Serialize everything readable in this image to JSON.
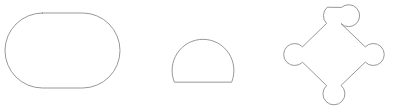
{
  "page": {
    "background_color": "#ffffff",
    "width": 393,
    "height": 109
  },
  "style": {
    "stroke_color": "#8c8c8c",
    "stroke_width": 0.9,
    "fill": "none"
  },
  "figure": {
    "shape_count": 3
  },
  "shapes": [
    {
      "index": 1,
      "name": "stadium-rounded-rectangle",
      "label": "Rounded rectangle (stadium)",
      "position": "left",
      "bounds": {
        "x": 5,
        "y": 13,
        "width": 115,
        "height": 75
      },
      "center": {
        "x": 62.5,
        "y": 50.5
      },
      "corner_radius": 37.5,
      "path": "M 42.5 13 L 82.5 13 A 37.5 37.5 0 0 1 82.5 88 L 42.5 88 A 37.5 37.5 0 0 1 42.5 13 Z"
    },
    {
      "index": 2,
      "name": "flat-bottom-circle-dome",
      "label": "Circle with flat bottom (dome)",
      "position": "center",
      "bounds": {
        "x": 172,
        "y": 23,
        "width": 62,
        "height": 59
      },
      "center": {
        "x": 203,
        "y": 54
      },
      "radius": 31,
      "flat_bottom_y": 82,
      "path": "M 174.2 81.8 A 31 31 0 1 1 231.8 81.8 Z"
    },
    {
      "index": 3,
      "name": "diamond-with-circular-vertices",
      "label": "Diamond with circular bulges at four vertices",
      "position": "right",
      "bounds": {
        "x": 283,
        "y": 4,
        "width": 102,
        "height": 101
      },
      "center": {
        "x": 334,
        "y": 54.5
      },
      "vertex_circle_radius": 11,
      "vertices": [
        {
          "name": "top",
          "x": 334,
          "y": 15
        },
        {
          "name": "right",
          "x": 373,
          "y": 54.5
        },
        {
          "name": "bottom",
          "x": 334,
          "y": 94
        },
        {
          "name": "left",
          "x": 294,
          "y": 54.5
        }
      ],
      "path": "M 341.6 7.2 A 11 11 0 1 1 341.0 23.6 L 365.3 46.9 A 11 11 0 1 1 365.3 62.1 L 341.0 85.4 A 11 11 0 1 1 326.6 85.6 L 302.5 62.2 A 11 11 0 1 1 302.5 46.8 L 326.6 23.4 A 11 11 0 0 1 326.9 7.5 Z"
    }
  ]
}
